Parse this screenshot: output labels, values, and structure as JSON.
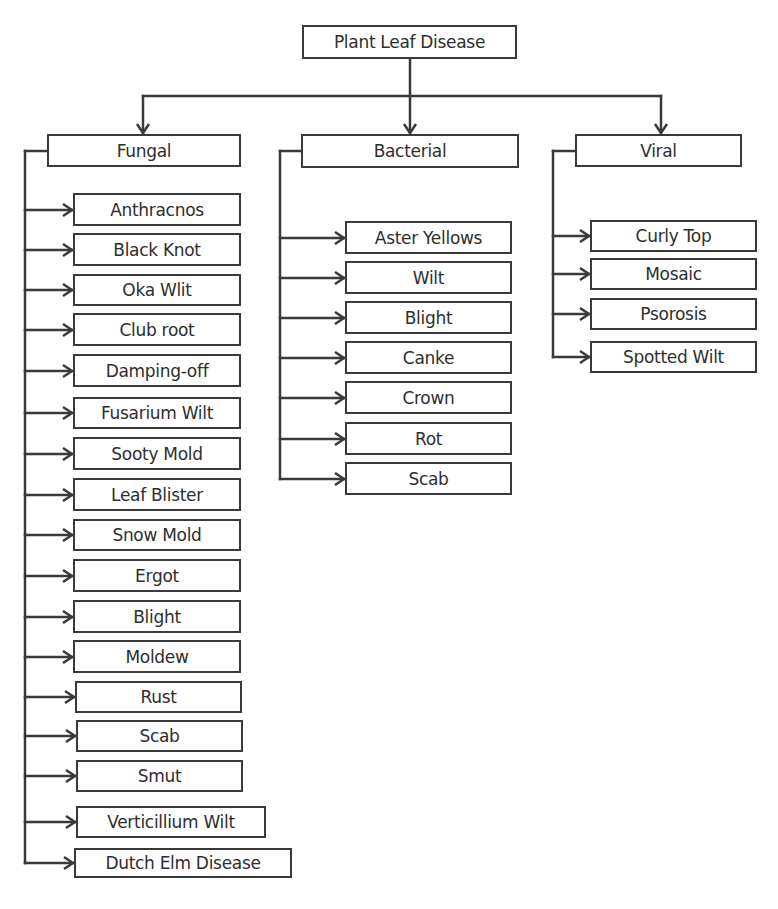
{
  "diagram": {
    "root": {
      "label": "Plant Leaf Disease",
      "box": [
        302,
        25,
        517,
        59
      ]
    },
    "line_color": "#3a3a3a",
    "categories": [
      {
        "label": "Fungal",
        "box": [
          47,
          134,
          241,
          167
        ],
        "bus_x": 25,
        "items": [
          {
            "label": "Anthracnos",
            "box": [
              73,
              193,
              241,
              226
            ]
          },
          {
            "label": "Black Knot",
            "box": [
              73,
              233,
              241,
              266
            ]
          },
          {
            "label": "Oka Wlit",
            "box": [
              73,
              274,
              241,
              306
            ]
          },
          {
            "label": "Club root",
            "box": [
              73,
              313,
              241,
              346
            ]
          },
          {
            "label": "Damping-off",
            "box": [
              73,
              354,
              241,
              387
            ]
          },
          {
            "label": "Fusarium Wilt",
            "box": [
              73,
              397,
              241,
              429
            ]
          },
          {
            "label": "Sooty Mold",
            "box": [
              73,
              437,
              241,
              470
            ]
          },
          {
            "label": "Leaf Blister",
            "box": [
              73,
              478,
              241,
              511
            ]
          },
          {
            "label": "Snow Mold",
            "box": [
              73,
              519,
              241,
              551
            ]
          },
          {
            "label": "Ergot",
            "box": [
              73,
              559,
              241,
              592
            ]
          },
          {
            "label": "Blight",
            "box": [
              73,
              600,
              241,
              633
            ]
          },
          {
            "label": "Moldew",
            "box": [
              73,
              640,
              241,
              673
            ]
          },
          {
            "label": "Rust",
            "box": [
              75,
              681,
              242,
              713
            ]
          },
          {
            "label": "Scab",
            "box": [
              76,
              720,
              243,
              752
            ]
          },
          {
            "label": "Smut",
            "box": [
              76,
              760,
              243,
              792
            ]
          },
          {
            "label": "Verticillium Wilt",
            "box": [
              76,
              806,
              266,
              838
            ]
          },
          {
            "label": "Dutch Elm Disease",
            "box": [
              74,
              848,
              292,
              878
            ]
          }
        ]
      },
      {
        "label": "Bacterial",
        "box": [
          301,
          134,
          519,
          168
        ],
        "bus_x": 280,
        "items": [
          {
            "label": "Aster Yellows",
            "box": [
              345,
              221,
              512,
              254
            ]
          },
          {
            "label": "Wilt",
            "box": [
              345,
              261,
              512,
              294
            ]
          },
          {
            "label": "Blight",
            "box": [
              345,
              301,
              512,
              334
            ]
          },
          {
            "label": "Canke",
            "box": [
              345,
              341,
              512,
              374
            ]
          },
          {
            "label": "Crown",
            "box": [
              345,
              381,
              512,
              414
            ]
          },
          {
            "label": "Rot",
            "box": [
              345,
              422,
              512,
              455
            ]
          },
          {
            "label": "Scab",
            "box": [
              345,
              462,
              512,
              495
            ]
          }
        ]
      },
      {
        "label": "Viral",
        "box": [
          575,
          134,
          742,
          167
        ],
        "bus_x": 553,
        "items": [
          {
            "label": "Curly Top",
            "box": [
              590,
              220,
              757,
              252
            ]
          },
          {
            "label": "Mosaic",
            "box": [
              590,
              258,
              757,
              290
            ]
          },
          {
            "label": "Psorosis",
            "box": [
              590,
              298,
              757,
              330
            ]
          },
          {
            "label": "Spotted Wilt",
            "box": [
              590,
              341,
              757,
              373
            ]
          }
        ]
      }
    ],
    "trunk": {
      "y": 96,
      "x_left": 143,
      "x_right": 661
    }
  }
}
